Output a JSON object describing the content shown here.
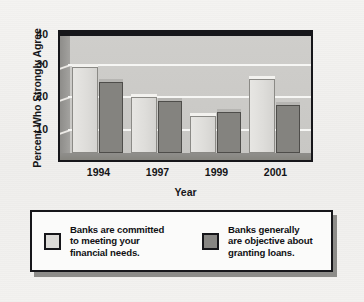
{
  "chart_data": {
    "type": "bar",
    "title": "",
    "subtitle": "",
    "xlabel": "Year",
    "ylabel": "Percent Who Strongly Agree",
    "categories": [
      "1994",
      "1997",
      "1999",
      "2001"
    ],
    "ylim": [
      10,
      42
    ],
    "yticks": [
      10,
      20,
      30,
      40
    ],
    "ytick_labels": [
      "10",
      "20",
      "30",
      "40"
    ],
    "grid": "horizontal-white-gridlines",
    "legend_position": "below-plot",
    "series": [
      {
        "name": "Banks are committed to meeting your financial needs.",
        "short_name": "committed-to-needs",
        "color": "#dcdbd8",
        "values": [
          33,
          25,
          20,
          30
        ]
      },
      {
        "name": "Banks generally are objective about granting loans.",
        "short_name": "objective-granting-loans",
        "color": "#878683",
        "values": [
          29,
          24,
          21,
          23
        ]
      }
    ]
  },
  "axes": {
    "y_title": "Percent Who Strongly Agree",
    "x_title": "Year",
    "y_ticks": [
      "40",
      "30",
      "20",
      "10"
    ],
    "x_ticks": [
      "1994",
      "1997",
      "1999",
      "2001"
    ]
  },
  "legend": {
    "entries": [
      {
        "swatch": "light-gray-swatch",
        "line1": "Banks are committed",
        "line2": "to meeting your",
        "line3": "financial needs."
      },
      {
        "swatch": "dark-gray-swatch",
        "line1": "Banks generally",
        "line2": "are objective about",
        "line3": "granting loans."
      }
    ]
  },
  "caption": {
    "partial_text": ""
  },
  "colors": {
    "page_background": "#f2f1ef",
    "plot_background": "#cdccc9",
    "plot_sidewall": "#97968f",
    "frame": "#16161a",
    "gridline": "#f6f6f4",
    "series_light": "#dcdbd8",
    "series_dark": "#878683",
    "legend_background": "#fbfbfa",
    "legend_shadow": "#8d8c89"
  }
}
